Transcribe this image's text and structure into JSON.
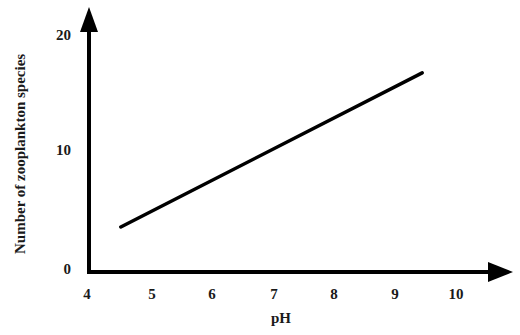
{
  "chart_data": {
    "type": "line",
    "title": "",
    "subtitle": "",
    "xlabel": "pH",
    "ylabel": "Number of zooplankton species",
    "xlim": [
      4,
      10
    ],
    "ylim": [
      0,
      21
    ],
    "xticks": [
      "4",
      "5",
      "6",
      "7",
      "8",
      "9",
      "10"
    ],
    "xtick_values": [
      4,
      5,
      6,
      7,
      8,
      9,
      10
    ],
    "yticks": [
      "0",
      "10",
      "20"
    ],
    "ytick_values": [
      0,
      10,
      20
    ],
    "grid": false,
    "legend": null,
    "legend_position": "none",
    "axis_style": "arrow-tipped L-shaped axes, no tick marks",
    "line_color": "#000000",
    "line_width_px": 3.5,
    "series": [
      {
        "name": "Zooplankton species richness vs pH",
        "x": [
          4.55,
          9.45
        ],
        "y": [
          3.8,
          16.8
        ]
      }
    ],
    "annotations": []
  },
  "figure": {
    "background_color": "#ffffff",
    "text_color": "#1a1a1a"
  }
}
